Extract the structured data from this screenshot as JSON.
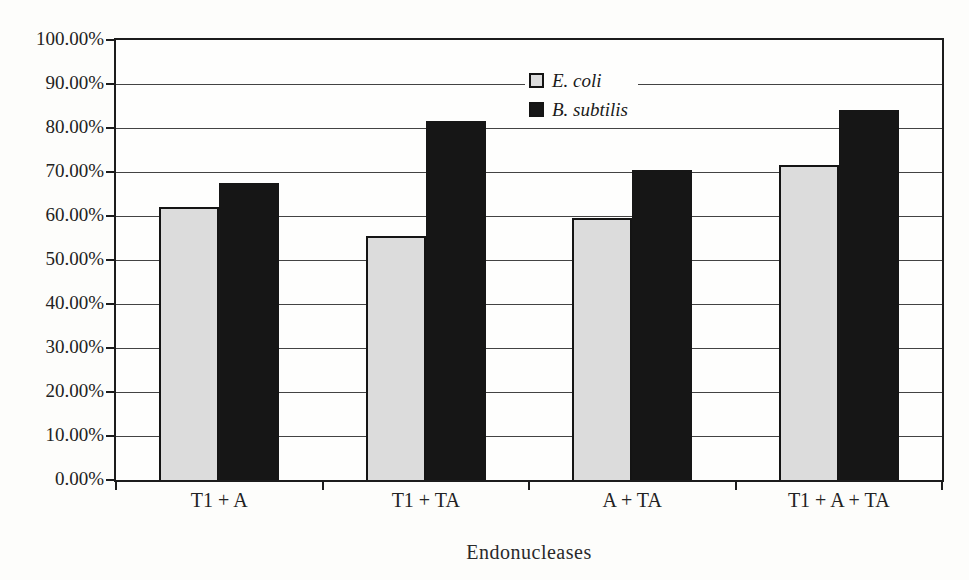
{
  "chart_data": {
    "type": "bar",
    "title": "",
    "xlabel": "Endonucleases",
    "ylabel": "",
    "categories": [
      "T1 + A",
      "T1 + TA",
      "A + TA",
      "T1 + A + TA"
    ],
    "series": [
      {
        "name": "E. coli",
        "color": "#dcdcdc",
        "values": [
          62,
          55.5,
          59.5,
          71.5
        ]
      },
      {
        "name": "B. subtilis",
        "color": "#161616",
        "values": [
          67.5,
          81.5,
          70.5,
          84
        ]
      }
    ],
    "ylim": [
      0,
      100
    ],
    "ytick_step": 10,
    "ytick_labels": [
      "0.00%",
      "10.00%",
      "20.00%",
      "30.00%",
      "40.00%",
      "50.00%",
      "60.00%",
      "70.00%",
      "80.00%",
      "90.00%",
      "100.00%"
    ],
    "grid": true,
    "legend_position": "inside-top-center",
    "legend_entries": [
      "E. coli",
      "B. subtilis"
    ]
  },
  "colors": {
    "bar_e_coli": "#dcdcdc",
    "bar_b_subtilis": "#161616",
    "axis": "#1c1c1c",
    "gridline": "#434343",
    "background": "#fdfdfb",
    "text": "#222222"
  }
}
